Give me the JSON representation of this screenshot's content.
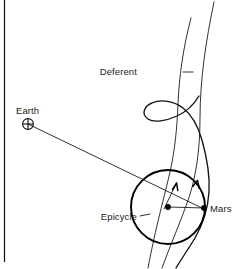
{
  "figure": {
    "background_color": "#ffffff",
    "ink_color": "#111111",
    "width": 243,
    "height": 269
  },
  "labels": {
    "earth": "Earth",
    "deferent": "Deferent",
    "epicycle": "Epicycle",
    "mars": "Mars"
  },
  "symbols": {
    "earth_symbol": "earth-glyph-circle-cross",
    "mars_marker": "filled-dot",
    "epicycle_center_marker": "filled-dot"
  },
  "annotations": {
    "deferent_leader": "leader-dash",
    "epicycle_leader": "leader-dash",
    "sight_line": "earth-to-mars-line",
    "epicycle_motion_arrow": "arrowhead-up-right",
    "trajectory_motion_arrow": "arrowhead-up-right"
  },
  "caption": {
    "partial_text": ""
  },
  "frame": {
    "left_rule": "vertical-rule"
  }
}
